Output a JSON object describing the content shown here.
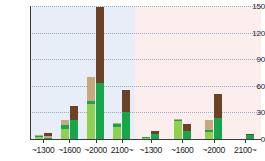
{
  "chart_data": {
    "type": "bar",
    "title": "",
    "xlabel": "",
    "ylabel": "",
    "ylim": [
      0,
      150
    ],
    "yticks": [
      0,
      30,
      60,
      90,
      120,
      150
    ],
    "grid": true,
    "legend": "none",
    "stacked": true,
    "panels": [
      {
        "name": "panel-left",
        "background": "#e8eef7",
        "categories": [
          "~1300",
          "~1600",
          "~2000",
          "2100~"
        ],
        "bars": [
          {
            "group": "~1300",
            "index": 0,
            "segments": [
              2,
              1,
              1,
              0
            ],
            "total": 4
          },
          {
            "group": "~1300",
            "index": 1,
            "segments": [
              0,
              1,
              2,
              4
            ],
            "total": 7
          },
          {
            "group": "~1600",
            "index": 0,
            "segments": [
              11,
              5,
              5,
              0
            ],
            "total": 21
          },
          {
            "group": "~1600",
            "index": 1,
            "segments": [
              0,
              22,
              0,
              15
            ],
            "total": 37
          },
          {
            "group": "~2000",
            "index": 0,
            "segments": [
              40,
              3,
              27,
              0
            ],
            "total": 70
          },
          {
            "group": "~2000",
            "index": 1,
            "segments": [
              0,
              63,
              0,
              86
            ],
            "total": 149
          },
          {
            "group": "2100~",
            "index": 0,
            "segments": [
              14,
              3,
              1,
              0
            ],
            "total": 18
          },
          {
            "group": "2100~",
            "index": 1,
            "segments": [
              0,
              31,
              0,
              24
            ],
            "total": 55
          }
        ]
      },
      {
        "name": "panel-right",
        "background": "#fbeeec",
        "categories": [
          "~1300",
          "~1600",
          "~2000",
          "2100~"
        ],
        "bars": [
          {
            "group": "~1300",
            "index": 0,
            "segments": [
              1,
              1,
              0,
              0
            ],
            "total": 2
          },
          {
            "group": "~1300",
            "index": 1,
            "segments": [
              0,
              6,
              0,
              3
            ],
            "total": 9
          },
          {
            "group": "~1600",
            "index": 0,
            "segments": [
              20,
              2,
              1,
              0
            ],
            "total": 23
          },
          {
            "group": "~1600",
            "index": 1,
            "segments": [
              0,
              9,
              0,
              8
            ],
            "total": 17
          },
          {
            "group": "~2000",
            "index": 0,
            "segments": [
              8,
              2,
              12,
              0
            ],
            "total": 22
          },
          {
            "group": "~2000",
            "index": 1,
            "segments": [
              0,
              24,
              0,
              27
            ],
            "total": 51
          },
          {
            "group": "2100~",
            "index": 0,
            "segments": [
              0,
              0,
              0,
              0
            ],
            "total": 0
          },
          {
            "group": "2100~",
            "index": 1,
            "segments": [
              0,
              5,
              0,
              1
            ],
            "total": 6
          }
        ]
      }
    ],
    "series_names": [
      "light-green",
      "green",
      "tan",
      "brown"
    ],
    "series_colors": [
      "#8fd14f",
      "#17a64a",
      "#c8a87c",
      "#6b4226"
    ]
  }
}
